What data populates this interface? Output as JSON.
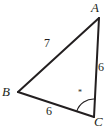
{
  "figure": {
    "type": "triangle-diagram",
    "background_color": "#ffffff",
    "stroke_color": "#231f20",
    "text_color": "#231f20",
    "width": 112,
    "height": 128,
    "vertices": [
      {
        "name": "A",
        "label": "A",
        "x": 99,
        "y": 18
      },
      {
        "name": "B",
        "label": "B",
        "x": 18,
        "y": 92
      },
      {
        "name": "C",
        "label": "C",
        "x": 94,
        "y": 117
      }
    ],
    "sides": [
      {
        "name": "side-AB",
        "label": "7",
        "from": "B",
        "to": "A",
        "length": 7
      },
      {
        "name": "side-AC",
        "label": "6",
        "from": "A",
        "to": "C",
        "length": 6
      },
      {
        "name": "side-BC",
        "label": "6",
        "from": "B",
        "to": "C",
        "length": 6
      }
    ],
    "angles": [
      {
        "name": "angle-C",
        "at": "C",
        "marker": "*",
        "arc_radius": 18
      }
    ]
  }
}
